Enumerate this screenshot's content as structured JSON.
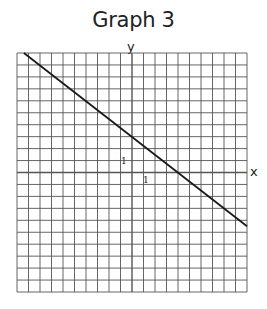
{
  "chart_data": {
    "type": "line",
    "title": "Graph 3",
    "xlabel": "x",
    "ylabel": "y",
    "xlim": [
      -10,
      10
    ],
    "ylim": [
      -10,
      10
    ],
    "grid": true,
    "tick_labels": {
      "x_unit": "1",
      "y_unit": "1"
    },
    "series": [
      {
        "name": "line",
        "equation": "y = -3/4 x + 3",
        "slope": -0.75,
        "y_intercept": 3,
        "x_intercept": 4,
        "x": [
          -9.4,
          10
        ],
        "y": [
          10,
          -4.5
        ]
      }
    ],
    "legend": null
  },
  "colors": {
    "grid": "#555555",
    "line": "#1a1a1a",
    "background": "#ffffff"
  }
}
